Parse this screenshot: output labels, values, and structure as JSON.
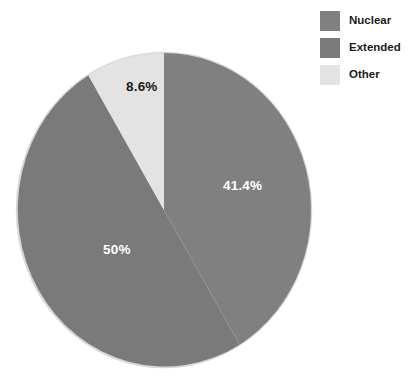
{
  "chart_data": {
    "type": "pie",
    "title": "",
    "categories": [
      "Nuclear",
      "Extended",
      "Other"
    ],
    "values": [
      41.4,
      50,
      8.6
    ],
    "value_labels": [
      "41.4%",
      "50%",
      "8.6%"
    ],
    "colors": [
      "#808080",
      "#7a7a7a",
      "#e3e3e3"
    ],
    "label_text_colors": [
      "#ffffff",
      "#ffffff",
      "#1a1a1a"
    ],
    "start_angle_deg": 0,
    "direction": "clockwise",
    "units": "percent",
    "legend": {
      "position": "top-right",
      "entries": [
        {
          "label": "Nuclear",
          "color": "#808080"
        },
        {
          "label": "Extended",
          "color": "#7a7a7a"
        },
        {
          "label": "Other",
          "color": "#e3e3e3"
        }
      ]
    },
    "grid": false,
    "xlabel": "",
    "ylabel": ""
  },
  "pie": {
    "slices": [
      {
        "name": "Nuclear",
        "percent_label": "41.4%"
      },
      {
        "name": "Extended",
        "percent_label": "50%"
      },
      {
        "name": "Other",
        "percent_label": "8.6%"
      }
    ]
  },
  "legend": {
    "items": [
      {
        "label": "Nuclear"
      },
      {
        "label": "Extended"
      },
      {
        "label": "Other"
      }
    ]
  },
  "style": {
    "background": "#ffffff",
    "outline": "#d8d8d8"
  }
}
